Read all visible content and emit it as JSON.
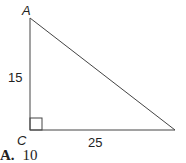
{
  "diagram": {
    "type": "right-triangle",
    "vertices": {
      "A": {
        "label": "A"
      },
      "C": {
        "label": "C",
        "right_angle": true
      },
      "B": {
        "label": ""
      }
    },
    "sides": {
      "AC": {
        "label": "15"
      },
      "CB": {
        "label": "25"
      }
    },
    "stroke_color": "#444444"
  },
  "answer_choice": {
    "letter": "A.",
    "value": "10"
  }
}
